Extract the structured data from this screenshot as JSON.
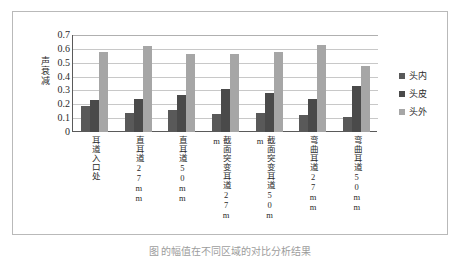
{
  "figure": {
    "caption": "图     的幅值在不同区域的对比分析结果",
    "caption_visible": "partially-clipped"
  },
  "chart_data": {
    "type": "bar",
    "title": "",
    "xlabel": "",
    "ylabel": "声衰减",
    "ylim": [
      0,
      0.7
    ],
    "ytick_values": [
      0,
      0.1,
      0.2,
      0.3,
      0.4,
      0.5,
      0.6,
      0.7
    ],
    "ytick_labels": [
      "0",
      "0.1",
      "0.2",
      "0.3",
      "0.4",
      "0.5",
      "0.6",
      "0.7"
    ],
    "grid": true,
    "legend_position": "right",
    "categories": [
      "耳道入口处",
      "直耳道27mm",
      "直耳道50mm",
      "截面突变耳道27mm",
      "截面突变耳道50mm",
      "弯曲耳道27mm",
      "弯曲耳道50mm"
    ],
    "series": [
      {
        "name": "头内",
        "color": "#595959",
        "values": [
          0.19,
          0.14,
          0.16,
          0.13,
          0.14,
          0.12,
          0.11
        ]
      },
      {
        "name": "头皮",
        "color": "#4a4a4a",
        "values": [
          0.23,
          0.24,
          0.27,
          0.31,
          0.28,
          0.24,
          0.33
        ]
      },
      {
        "name": "头外",
        "color": "#a6a6a6",
        "values": [
          0.58,
          0.62,
          0.56,
          0.56,
          0.58,
          0.63,
          0.48
        ]
      }
    ]
  },
  "colors": {
    "axis": "#5a5a5a",
    "grid": "#c8c8c8",
    "frame": "#b9b9b9",
    "text": "#2b2b2b"
  }
}
